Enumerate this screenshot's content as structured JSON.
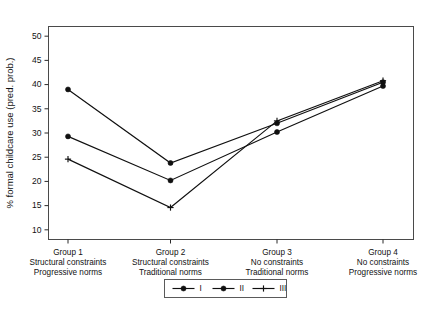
{
  "chart_data": {
    "type": "line",
    "title": "",
    "subtitle": "",
    "xlabel": "",
    "ylabel": "% formal childcare use (pred. prob.)",
    "ylim": [
      8,
      52
    ],
    "yticks": [
      10,
      15,
      20,
      25,
      30,
      35,
      40,
      45,
      50
    ],
    "ytick_labels": [
      "10",
      "15",
      "20",
      "25",
      "30",
      "35",
      "40",
      "45",
      "50"
    ],
    "grid": false,
    "legend_position": "bottom-center",
    "categories": [
      "Group 1",
      "Group 2",
      "Group 3",
      "Group 4"
    ],
    "category_sublabels": [
      [
        "Structural constraints",
        "Progressive norms"
      ],
      [
        "Structural constraints",
        "Traditional norms"
      ],
      [
        "No constraints",
        "Traditional norms"
      ],
      [
        "No constraints",
        "Progressive norms"
      ]
    ],
    "series": [
      {
        "name": "I",
        "marker": "circle",
        "values": [
          39.0,
          23.8,
          32.0,
          40.5
        ]
      },
      {
        "name": "II",
        "marker": "circle",
        "values": [
          29.3,
          20.2,
          30.2,
          39.7
        ]
      },
      {
        "name": "III",
        "marker": "plus",
        "values": [
          24.6,
          14.6,
          32.5,
          40.8
        ]
      }
    ],
    "legend_entries": [
      "I",
      "II",
      "III"
    ],
    "colors": {
      "line": "#101010",
      "axis": "#2b2b2b",
      "frame": "#4a4a4a",
      "background": "#ffffff"
    }
  }
}
